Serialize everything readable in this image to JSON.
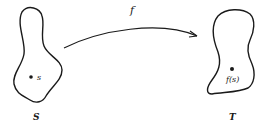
{
  "diagram": {
    "type": "function-mapping",
    "sets": [
      {
        "id": "S",
        "label": "S",
        "element_label": "s"
      },
      {
        "id": "T",
        "label": "T",
        "element_label": "f(s)"
      }
    ],
    "arrow": {
      "from": "S",
      "to": "T",
      "label": "f"
    },
    "colors": {
      "stroke": "#1a1a1a",
      "background": "#ffffff"
    }
  }
}
